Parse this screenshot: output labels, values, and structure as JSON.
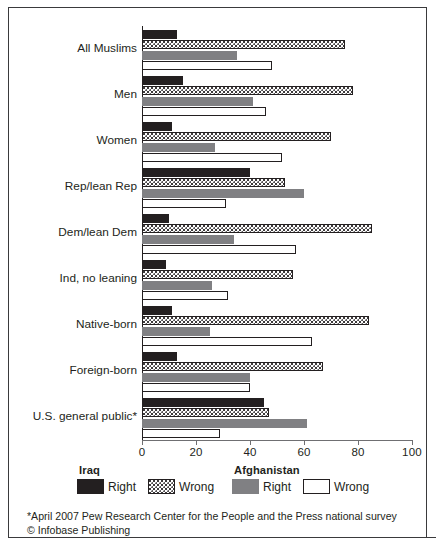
{
  "chart_data": {
    "type": "bar",
    "orientation": "horizontal",
    "title": "",
    "xlabel": "",
    "ylabel": "",
    "xlim": [
      0,
      100
    ],
    "xticks": [
      0,
      20,
      40,
      60,
      80,
      100
    ],
    "grid": false,
    "legend_position": "bottom",
    "categories": [
      "All Muslims",
      "Men",
      "Women",
      "Rep/lean Rep",
      "Dem/lean Dem",
      "Ind, no leaning",
      "Native-born",
      "Foreign-born",
      "U.S. general public*"
    ],
    "series": [
      {
        "name": "Right",
        "group": "Iraq",
        "color": "#231f20",
        "fill": "solid",
        "values": [
          13,
          15,
          11,
          40,
          10,
          9,
          11,
          13,
          45
        ]
      },
      {
        "name": "Wrong",
        "group": "Iraq",
        "color": "#ffffff",
        "fill": "dotted",
        "values": [
          75,
          78,
          70,
          53,
          85,
          56,
          84,
          67,
          47
        ]
      },
      {
        "name": "Right",
        "group": "Afghanistan",
        "color": "#808083",
        "fill": "solid",
        "values": [
          35,
          41,
          27,
          60,
          34,
          26,
          25,
          40,
          61
        ]
      },
      {
        "name": "Wrong",
        "group": "Afghanistan",
        "color": "#ffffff",
        "fill": "outline",
        "values": [
          48,
          46,
          52,
          31,
          57,
          32,
          63,
          40,
          29
        ]
      }
    ]
  },
  "legend": {
    "groups": [
      {
        "title": "Iraq",
        "items": [
          {
            "label": "Right",
            "swatch": "black"
          },
          {
            "label": "Wrong",
            "swatch": "dots"
          }
        ]
      },
      {
        "title": "Afghanistan",
        "items": [
          {
            "label": "Right",
            "swatch": "gray"
          },
          {
            "label": "Wrong",
            "swatch": "white"
          }
        ]
      }
    ]
  },
  "footnotes": [
    "*April 2007 Pew Research Center for the People and the Press national survey",
    "© Infobase Publishing"
  ],
  "colors": {
    "iraq_right": "#231f20",
    "afghanistan_right": "#808083",
    "frame": "#3a3a3c",
    "text": "#231f20"
  }
}
